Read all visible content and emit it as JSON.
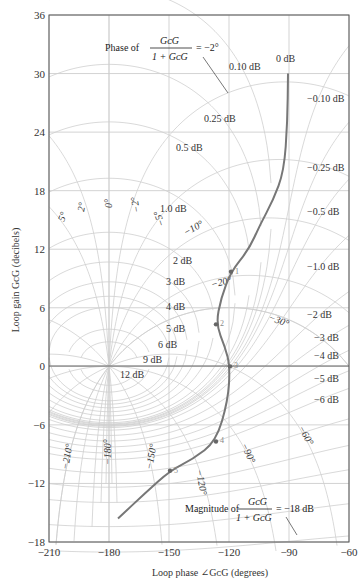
{
  "chart_data": {
    "type": "line",
    "xlabel": "Loop phase ∠G_cG (degrees)",
    "ylabel": "Loop gain G_cG (decibels)",
    "xlim": [
      -210,
      -60
    ],
    "ylim": [
      -18,
      36
    ],
    "grid": true,
    "xticks": [
      -210,
      -180,
      -150,
      -120,
      -90,
      -60
    ],
    "yticks": [
      -18,
      -12,
      -6,
      0,
      6,
      12,
      18,
      24,
      30,
      36
    ],
    "series": [
      {
        "name": "Loop response G_cG",
        "x": [
          -90.5,
          -90.8,
          -92.5,
          -98,
          -104.5,
          -110,
          -119,
          -124,
          -126.5,
          -122,
          -119.5,
          -120.5,
          -126.5,
          -138,
          -149.5,
          -162,
          -175.5
        ],
        "y": [
          30,
          25,
          20,
          17,
          14.5,
          12,
          9.7,
          7,
          4.3,
          2,
          0,
          -3.5,
          -7.7,
          -9.5,
          -10.7,
          -13,
          -15.6
        ]
      }
    ],
    "marked_points": [
      {
        "label": "1",
        "x": -119,
        "y": 9.7
      },
      {
        "label": "2",
        "x": -126.5,
        "y": 4.3
      },
      {
        "label": "3",
        "x": -119.5,
        "y": 0
      },
      {
        "label": "4",
        "x": -126.5,
        "y": -7.7
      },
      {
        "label": "5",
        "x": -149.5,
        "y": -10.7
      }
    ],
    "closed_loop_magnitude_contours_db": [
      "0 dB",
      "0.10 dB",
      "0.25 dB",
      "0.5 dB",
      "1.0 dB",
      "2 dB",
      "3 dB",
      "4 dB",
      "5 dB",
      "6 dB",
      "9 dB",
      "12 dB",
      "−0.10 dB",
      "−0.25 dB",
      "−0.5 dB",
      "−1.0 dB",
      "−2 dB",
      "−3 dB",
      "−4 dB",
      "−5 dB",
      "−6 dB"
    ],
    "closed_loop_phase_contours_deg": [
      "5°",
      "2°",
      "0°",
      "−2°",
      "−5°",
      "−10°",
      "−20°",
      "−30°",
      "−60°",
      "−90°",
      "−120°",
      "−150°",
      "−180°",
      "−210°"
    ],
    "annotations": [
      {
        "text": "Phase of G_cG/(1+G_cG) = −2°"
      },
      {
        "text": "Magnitude of G_cG/(1+G_cG) = −18 dB"
      }
    ]
  },
  "labels": {
    "xticks": [
      "−210",
      "−180",
      "−150",
      "−120",
      "−90",
      "−60"
    ],
    "yticks": [
      "36",
      "30",
      "24",
      "18",
      "12",
      "6",
      "0",
      "−6",
      "−12",
      "−18"
    ],
    "xlabel": "Loop phase ∠GᴄG (degrees)",
    "ylabel": "Loop gain GᴄG (decibels)",
    "phase_annot_prefix": "Phase of",
    "phase_annot_num": "GᴄG",
    "phase_annot_den": "1 + GᴄG",
    "phase_annot_val": "= −2°",
    "mag_annot_prefix": "Magnitude of",
    "mag_annot_num": "GᴄG",
    "mag_annot_den": "1 + GᴄG",
    "mag_annot_val": "= −18 dB",
    "m_pos": [
      {
        "t": "0 dB",
        "x": 276,
        "y": 62
      },
      {
        "t": "0.10 dB",
        "x": 229,
        "y": 70
      },
      {
        "t": "0.25 dB",
        "x": 204,
        "y": 122
      },
      {
        "t": "0.5 dB",
        "x": 176,
        "y": 151
      },
      {
        "t": "1.0 dB",
        "x": 160,
        "y": 212
      },
      {
        "t": "2 dB",
        "x": 173,
        "y": 264
      },
      {
        "t": "3 dB",
        "x": 166,
        "y": 285
      },
      {
        "t": "4 dB",
        "x": 166,
        "y": 310
      },
      {
        "t": "5 dB",
        "x": 166,
        "y": 332
      },
      {
        "t": "6 dB",
        "x": 158,
        "y": 348
      },
      {
        "t": "9 dB",
        "x": 143,
        "y": 363
      },
      {
        "t": "12 dB",
        "x": 120,
        "y": 378
      },
      {
        "t": "−0.10 dB",
        "x": 307,
        "y": 102
      },
      {
        "t": "−0.25 dB",
        "x": 307,
        "y": 171
      },
      {
        "t": "−0.5 dB",
        "x": 307,
        "y": 215
      },
      {
        "t": "−1.0 dB",
        "x": 307,
        "y": 270
      },
      {
        "t": "−2 dB",
        "x": 307,
        "y": 318
      },
      {
        "t": "−3 dB",
        "x": 314,
        "y": 341
      },
      {
        "t": "−4 dB",
        "x": 314,
        "y": 359
      },
      {
        "t": "−5 dB",
        "x": 314,
        "y": 382
      },
      {
        "t": "−6 dB",
        "x": 314,
        "y": 403
      }
    ],
    "p_pos": [
      {
        "t": "5°",
        "x": 64,
        "y": 222,
        "r": -70
      },
      {
        "t": "2°",
        "x": 84,
        "y": 212,
        "r": -80
      },
      {
        "t": "0°",
        "x": 112,
        "y": 208,
        "r": -90
      },
      {
        "t": "−2°",
        "x": 140,
        "y": 212,
        "r": -100
      },
      {
        "t": "−5°",
        "x": 165,
        "y": 225,
        "r": -110
      },
      {
        "t": "−10°",
        "x": 186,
        "y": 236,
        "r": -30
      },
      {
        "t": "−20°",
        "x": 212,
        "y": 288,
        "r": -15
      },
      {
        "t": "−30°",
        "x": 268,
        "y": 320,
        "r": 20
      },
      {
        "t": "−60°",
        "x": 298,
        "y": 428,
        "r": 60
      },
      {
        "t": "−90°",
        "x": 241,
        "y": 445,
        "r": 65
      },
      {
        "t": "−120°",
        "x": 196,
        "y": 470,
        "r": 80
      },
      {
        "t": "−150°",
        "x": 152,
        "y": 470,
        "r": -80
      },
      {
        "t": "−180°",
        "x": 111,
        "y": 465,
        "r": -90
      },
      {
        "t": "−210°",
        "x": 68,
        "y": 470,
        "r": -80
      }
    ]
  }
}
